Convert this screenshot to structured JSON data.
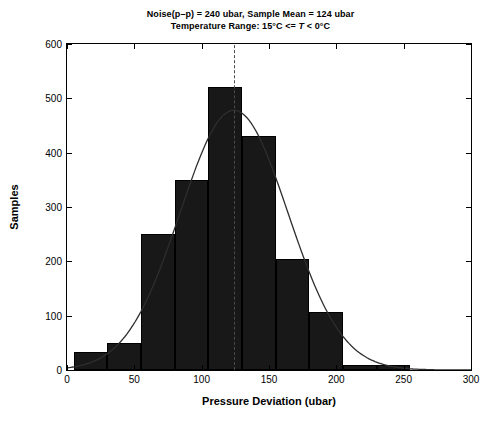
{
  "chart_data": {
    "type": "bar",
    "title": "Noise(p–p) = 240 ubar, Sample Mean = 124 ubar",
    "subtitle_prefix": "Temperature Range: 15°C <= ",
    "subtitle_var": "T",
    "subtitle_suffix": " < 0°C",
    "xlabel": "Pressure Deviation (ubar)",
    "ylabel": "Samples",
    "xlim": [
      0,
      300
    ],
    "ylim": [
      0,
      600
    ],
    "xticks": [
      0,
      50,
      100,
      150,
      200,
      250,
      300
    ],
    "yticks": [
      0,
      100,
      200,
      300,
      400,
      500,
      600
    ],
    "grid": false,
    "legend": "none",
    "bin_width": 25,
    "bin_edges": [
      5,
      30,
      55,
      80,
      105,
      130,
      155,
      180,
      205,
      230,
      255
    ],
    "bin_centers": [
      17.5,
      42.5,
      67.5,
      92.5,
      117.5,
      142.5,
      167.5,
      192.5,
      217.5,
      242.5
    ],
    "values": [
      33,
      50,
      250,
      350,
      520,
      430,
      205,
      107,
      10,
      10
    ],
    "annotations": {
      "mean_line_value": 124,
      "mean_line_style": "dashed",
      "overlay_curve": "gaussian-fit",
      "curve_mean": 124,
      "curve_sigma": 40,
      "curve_peak": 478
    },
    "colors": {
      "bar_fill": "#181818",
      "bar_edge": "#000000",
      "curve": "#2e2e2e",
      "mean_line": "#4a4a4a",
      "axis": "#000000",
      "background": "#ffffff"
    }
  },
  "noise_pp_label": "Noise(p–p) = 240 ubar, Sample Mean = 124 ubar"
}
